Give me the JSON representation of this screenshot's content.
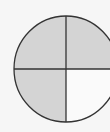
{
  "diagram": {
    "type": "fraction-circle",
    "total_parts": 4,
    "shaded_parts": 3,
    "shaded_quadrants": [
      "top-left",
      "top-right",
      "bottom-left"
    ],
    "unshaded_quadrants": [
      "bottom-right"
    ],
    "colors": {
      "background": "#f6f6f6",
      "shaded": "#d4d4d4",
      "unshaded": "#fafafa",
      "stroke": "#333333"
    }
  }
}
